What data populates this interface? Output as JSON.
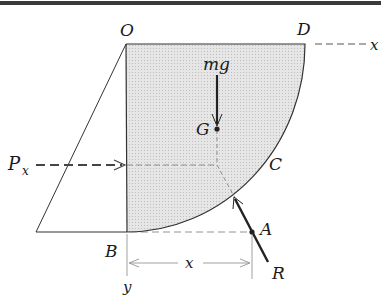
{
  "diagram": {
    "labels": {
      "O": "O",
      "D": "D",
      "x_axis": "x",
      "mg": "mg",
      "G": "G",
      "P": "P",
      "P_sub": "x",
      "C": "C",
      "A": "A",
      "B": "B",
      "x_dim": "x",
      "R": "R",
      "y_axis": "y"
    },
    "colors": {
      "fill": "#dcdcdc",
      "stroke": "#333333",
      "dashed": "#666666",
      "border": "#333333"
    }
  }
}
